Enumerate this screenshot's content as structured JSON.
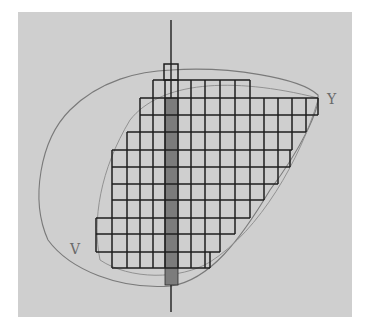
{
  "diagram": {
    "type": "hand-drawn sketch",
    "labels": {
      "upper_right": "Y",
      "lower_left": "V"
    },
    "colors": {
      "paper": "#cfcfcf",
      "ink": "#1e1e1e",
      "pencil": "#7a7a7a",
      "shaded_bar": "#6e6e6e"
    },
    "axis": {
      "x": 171,
      "y_top": 20,
      "y_bottom": 312
    },
    "top_box": {
      "x": 164,
      "y": 64,
      "w": 14,
      "h": 16
    },
    "shaded_bar": {
      "x": 165,
      "y": 98,
      "w": 13,
      "h": 187
    },
    "row_edges_y": [
      80,
      98,
      115,
      132,
      150,
      167,
      184,
      200,
      218,
      234,
      252,
      268
    ],
    "column_edges_x": [
      96,
      112,
      127,
      140,
      153,
      165,
      178,
      191,
      205,
      220,
      235,
      250,
      264,
      278,
      292,
      306,
      318
    ],
    "rows": [
      {
        "index": 0,
        "x_start": 153,
        "x_end": 250
      },
      {
        "index": 1,
        "x_start": 140,
        "x_end": 318
      },
      {
        "index": 2,
        "x_start": 140,
        "x_end": 306
      },
      {
        "index": 3,
        "x_start": 127,
        "x_end": 292
      },
      {
        "index": 4,
        "x_start": 112,
        "x_end": 290
      },
      {
        "index": 5,
        "x_start": 112,
        "x_end": 278
      },
      {
        "index": 6,
        "x_start": 112,
        "x_end": 264
      },
      {
        "index": 7,
        "x_start": 112,
        "x_end": 250
      },
      {
        "index": 8,
        "x_start": 96,
        "x_end": 235
      },
      {
        "index": 9,
        "x_start": 96,
        "x_end": 220
      },
      {
        "index": 10,
        "x_start": 112,
        "x_end": 210
      }
    ]
  }
}
